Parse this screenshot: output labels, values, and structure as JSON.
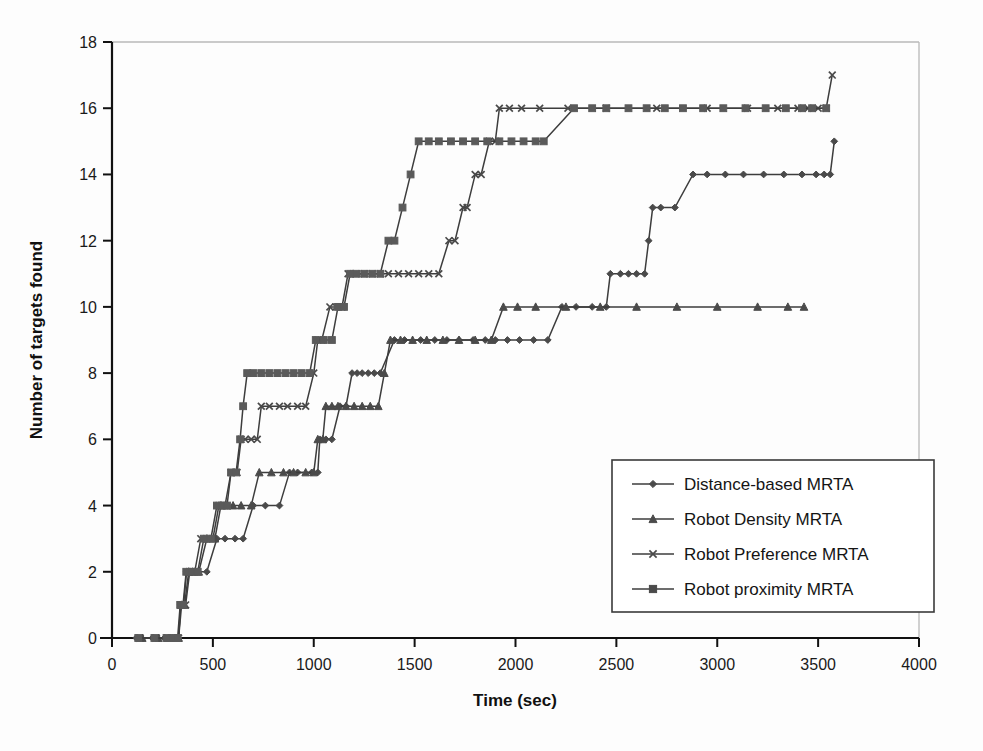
{
  "chart_data": {
    "type": "line",
    "title": "",
    "xlabel": "Time (sec)",
    "ylabel": "Number of targets found",
    "xlim": [
      0,
      4000
    ],
    "ylim": [
      0,
      18
    ],
    "xticks": [
      0,
      500,
      1000,
      1500,
      2000,
      2500,
      3000,
      3500,
      4000
    ],
    "yticks": [
      0,
      2,
      4,
      6,
      8,
      10,
      12,
      14,
      16,
      18
    ],
    "xtick_labels": [
      "0",
      "500",
      "1000",
      "1500",
      "2000",
      "2500",
      "3000",
      "3500",
      "4000"
    ],
    "ytick_labels": [
      "0",
      "2",
      "4",
      "6",
      "8",
      "10",
      "12",
      "14",
      "16",
      "18"
    ],
    "grid": false,
    "legend_position": "center-right",
    "series": [
      {
        "name": "Distance-based MRTA",
        "marker": "diamond",
        "color": "#4a4a4a",
        "points": [
          [
            120,
            0
          ],
          [
            200,
            0
          ],
          [
            260,
            0
          ],
          [
            300,
            0
          ],
          [
            330,
            0
          ],
          [
            340,
            1
          ],
          [
            355,
            1
          ],
          [
            370,
            2
          ],
          [
            390,
            2
          ],
          [
            410,
            2
          ],
          [
            470,
            2
          ],
          [
            520,
            3
          ],
          [
            560,
            3
          ],
          [
            610,
            3
          ],
          [
            650,
            3
          ],
          [
            700,
            4
          ],
          [
            760,
            4
          ],
          [
            830,
            4
          ],
          [
            880,
            5
          ],
          [
            920,
            5
          ],
          [
            990,
            5
          ],
          [
            1020,
            5
          ],
          [
            1030,
            6
          ],
          [
            1060,
            6
          ],
          [
            1090,
            6
          ],
          [
            1130,
            7
          ],
          [
            1160,
            7
          ],
          [
            1190,
            8
          ],
          [
            1215,
            8
          ],
          [
            1240,
            8
          ],
          [
            1270,
            8
          ],
          [
            1300,
            8
          ],
          [
            1330,
            8
          ],
          [
            1400,
            9
          ],
          [
            1450,
            9
          ],
          [
            1530,
            9
          ],
          [
            1600,
            9
          ],
          [
            1660,
            9
          ],
          [
            1720,
            9
          ],
          [
            1790,
            9
          ],
          [
            1850,
            9
          ],
          [
            1900,
            9
          ],
          [
            1960,
            9
          ],
          [
            2020,
            9
          ],
          [
            2090,
            9
          ],
          [
            2160,
            9
          ],
          [
            2230,
            10
          ],
          [
            2300,
            10
          ],
          [
            2380,
            10
          ],
          [
            2450,
            10
          ],
          [
            2470,
            11
          ],
          [
            2520,
            11
          ],
          [
            2560,
            11
          ],
          [
            2600,
            11
          ],
          [
            2640,
            11
          ],
          [
            2660,
            12
          ],
          [
            2680,
            13
          ],
          [
            2720,
            13
          ],
          [
            2790,
            13
          ],
          [
            2880,
            14
          ],
          [
            2950,
            14
          ],
          [
            3040,
            14
          ],
          [
            3130,
            14
          ],
          [
            3230,
            14
          ],
          [
            3330,
            14
          ],
          [
            3420,
            14
          ],
          [
            3490,
            14
          ],
          [
            3530,
            14
          ],
          [
            3560,
            14
          ],
          [
            3580,
            15
          ]
        ]
      },
      {
        "name": "Robot Density MRTA",
        "marker": "triangle",
        "color": "#4a4a4a",
        "points": [
          [
            150,
            0
          ],
          [
            230,
            0
          ],
          [
            280,
            0
          ],
          [
            310,
            0
          ],
          [
            330,
            0
          ],
          [
            345,
            1
          ],
          [
            360,
            1
          ],
          [
            380,
            2
          ],
          [
            400,
            2
          ],
          [
            430,
            2
          ],
          [
            470,
            3
          ],
          [
            510,
            3
          ],
          [
            540,
            4
          ],
          [
            570,
            4
          ],
          [
            600,
            4
          ],
          [
            640,
            4
          ],
          [
            690,
            4
          ],
          [
            730,
            5
          ],
          [
            790,
            5
          ],
          [
            850,
            5
          ],
          [
            900,
            5
          ],
          [
            960,
            5
          ],
          [
            1000,
            5
          ],
          [
            1020,
            6
          ],
          [
            1045,
            6
          ],
          [
            1060,
            7
          ],
          [
            1090,
            7
          ],
          [
            1120,
            7
          ],
          [
            1160,
            7
          ],
          [
            1200,
            7
          ],
          [
            1240,
            7
          ],
          [
            1280,
            7
          ],
          [
            1320,
            7
          ],
          [
            1350,
            8
          ],
          [
            1380,
            9
          ],
          [
            1430,
            9
          ],
          [
            1490,
            9
          ],
          [
            1560,
            9
          ],
          [
            1640,
            9
          ],
          [
            1720,
            9
          ],
          [
            1800,
            9
          ],
          [
            1880,
            9
          ],
          [
            1940,
            10
          ],
          [
            2010,
            10
          ],
          [
            2100,
            10
          ],
          [
            2250,
            10
          ],
          [
            2420,
            10
          ],
          [
            2600,
            10
          ],
          [
            2800,
            10
          ],
          [
            3000,
            10
          ],
          [
            3200,
            10
          ],
          [
            3350,
            10
          ],
          [
            3430,
            10
          ]
        ]
      },
      {
        "name": "Robot Preference MRTA",
        "marker": "x",
        "color": "#4a4a4a",
        "points": [
          [
            140,
            0
          ],
          [
            220,
            0
          ],
          [
            275,
            0
          ],
          [
            305,
            0
          ],
          [
            330,
            0
          ],
          [
            340,
            1
          ],
          [
            350,
            1
          ],
          [
            365,
            1
          ],
          [
            385,
            2
          ],
          [
            410,
            2
          ],
          [
            440,
            3
          ],
          [
            470,
            3
          ],
          [
            500,
            3
          ],
          [
            530,
            4
          ],
          [
            560,
            4
          ],
          [
            590,
            5
          ],
          [
            620,
            5
          ],
          [
            640,
            6
          ],
          [
            660,
            6
          ],
          [
            690,
            6
          ],
          [
            720,
            6
          ],
          [
            740,
            7
          ],
          [
            780,
            7
          ],
          [
            830,
            7
          ],
          [
            870,
            7
          ],
          [
            920,
            7
          ],
          [
            960,
            7
          ],
          [
            1000,
            8
          ],
          [
            1020,
            9
          ],
          [
            1040,
            9
          ],
          [
            1080,
            10
          ],
          [
            1110,
            10
          ],
          [
            1140,
            10
          ],
          [
            1170,
            11
          ],
          [
            1210,
            11
          ],
          [
            1250,
            11
          ],
          [
            1290,
            11
          ],
          [
            1330,
            11
          ],
          [
            1370,
            11
          ],
          [
            1420,
            11
          ],
          [
            1470,
            11
          ],
          [
            1520,
            11
          ],
          [
            1570,
            11
          ],
          [
            1620,
            11
          ],
          [
            1670,
            12
          ],
          [
            1700,
            12
          ],
          [
            1740,
            13
          ],
          [
            1760,
            13
          ],
          [
            1800,
            14
          ],
          [
            1830,
            14
          ],
          [
            1870,
            15
          ],
          [
            1900,
            15
          ],
          [
            1920,
            16
          ],
          [
            1970,
            16
          ],
          [
            2030,
            16
          ],
          [
            2120,
            16
          ],
          [
            2260,
            16
          ],
          [
            2450,
            16
          ],
          [
            2700,
            16
          ],
          [
            2950,
            16
          ],
          [
            3150,
            16
          ],
          [
            3300,
            16
          ],
          [
            3400,
            16
          ],
          [
            3450,
            16
          ],
          [
            3500,
            16
          ],
          [
            3540,
            16
          ],
          [
            3570,
            17
          ]
        ]
      },
      {
        "name": "Robot proximity MRTA",
        "marker": "square",
        "color": "#5a5a5a",
        "points": [
          [
            130,
            0
          ],
          [
            210,
            0
          ],
          [
            270,
            0
          ],
          [
            300,
            0
          ],
          [
            325,
            0
          ],
          [
            338,
            1
          ],
          [
            352,
            1
          ],
          [
            368,
            2
          ],
          [
            395,
            2
          ],
          [
            425,
            2
          ],
          [
            455,
            3
          ],
          [
            490,
            3
          ],
          [
            520,
            4
          ],
          [
            545,
            4
          ],
          [
            570,
            4
          ],
          [
            590,
            5
          ],
          [
            615,
            5
          ],
          [
            635,
            6
          ],
          [
            650,
            7
          ],
          [
            670,
            8
          ],
          [
            700,
            8
          ],
          [
            740,
            8
          ],
          [
            780,
            8
          ],
          [
            820,
            8
          ],
          [
            860,
            8
          ],
          [
            900,
            8
          ],
          [
            940,
            8
          ],
          [
            980,
            8
          ],
          [
            1010,
            9
          ],
          [
            1050,
            9
          ],
          [
            1090,
            9
          ],
          [
            1120,
            10
          ],
          [
            1150,
            10
          ],
          [
            1180,
            11
          ],
          [
            1210,
            11
          ],
          [
            1250,
            11
          ],
          [
            1290,
            11
          ],
          [
            1330,
            11
          ],
          [
            1370,
            12
          ],
          [
            1400,
            12
          ],
          [
            1440,
            13
          ],
          [
            1480,
            14
          ],
          [
            1520,
            15
          ],
          [
            1570,
            15
          ],
          [
            1620,
            15
          ],
          [
            1680,
            15
          ],
          [
            1740,
            15
          ],
          [
            1800,
            15
          ],
          [
            1860,
            15
          ],
          [
            1920,
            15
          ],
          [
            1980,
            15
          ],
          [
            2040,
            15
          ],
          [
            2100,
            15
          ],
          [
            2140,
            15
          ],
          [
            2290,
            16
          ],
          [
            2380,
            16
          ],
          [
            2450,
            16
          ],
          [
            2560,
            16
          ],
          [
            2650,
            16
          ],
          [
            2740,
            16
          ],
          [
            2830,
            16
          ],
          [
            2930,
            16
          ],
          [
            3030,
            16
          ],
          [
            3140,
            16
          ],
          [
            3240,
            16
          ],
          [
            3340,
            16
          ],
          [
            3420,
            16
          ],
          [
            3470,
            16
          ],
          [
            3540,
            16
          ]
        ]
      }
    ]
  },
  "legend": {
    "items": [
      {
        "label": "Distance-based MRTA",
        "marker": "diamond"
      },
      {
        "label": "Robot Density MRTA",
        "marker": "triangle"
      },
      {
        "label": "Robot Preference MRTA",
        "marker": "x"
      },
      {
        "label": "Robot proximity MRTA",
        "marker": "square"
      }
    ]
  },
  "colors": {
    "axis": "#111111",
    "series": "#4a4a4a",
    "frame": "#b9b9b9",
    "background": "#fdfdfd"
  }
}
